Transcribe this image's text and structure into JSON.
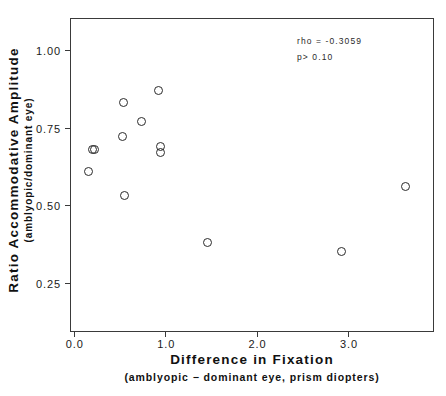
{
  "chart_data": {
    "type": "scatter",
    "title": "",
    "xlabel": "Difference in Fixation",
    "xlabel_sub": "(amblyopic − dominant eye, prism diopters)",
    "ylabel": "Ratio Accommodative Amplitude",
    "ylabel_sub": "(amblyopic/dominant eye)",
    "xlim": [
      -0.03,
      3.93
    ],
    "ylim": [
      0.095,
      1.1
    ],
    "grid": false,
    "legend": null,
    "xticks": [
      0.0,
      1.0,
      2.0,
      3.0
    ],
    "xtick_labels": [
      "0.0",
      "1.0",
      "2.0",
      "3.0"
    ],
    "yticks": [
      0.25,
      0.5,
      0.75,
      1.0
    ],
    "ytick_labels": [
      "0.25",
      "0.50",
      "0.75",
      "1.00"
    ],
    "marker": "open-circle",
    "marker_color": "#2b2b2b",
    "points": [
      {
        "x": 0.16,
        "y": 0.61
      },
      {
        "x": 0.21,
        "y": 0.68
      },
      {
        "x": 0.23,
        "y": 0.68
      },
      {
        "x": 0.53,
        "y": 0.72
      },
      {
        "x": 0.54,
        "y": 0.83
      },
      {
        "x": 0.55,
        "y": 0.53
      },
      {
        "x": 0.74,
        "y": 0.77
      },
      {
        "x": 0.93,
        "y": 0.87
      },
      {
        "x": 0.95,
        "y": 0.69
      },
      {
        "x": 0.95,
        "y": 0.67
      },
      {
        "x": 1.46,
        "y": 0.38
      },
      {
        "x": 2.93,
        "y": 0.35
      },
      {
        "x": 3.63,
        "y": 0.56
      }
    ],
    "annotations": [
      {
        "id": "rho",
        "text": "rho = -0.3059"
      },
      {
        "id": "pvalue",
        "text": "p> 0.10"
      }
    ]
  }
}
